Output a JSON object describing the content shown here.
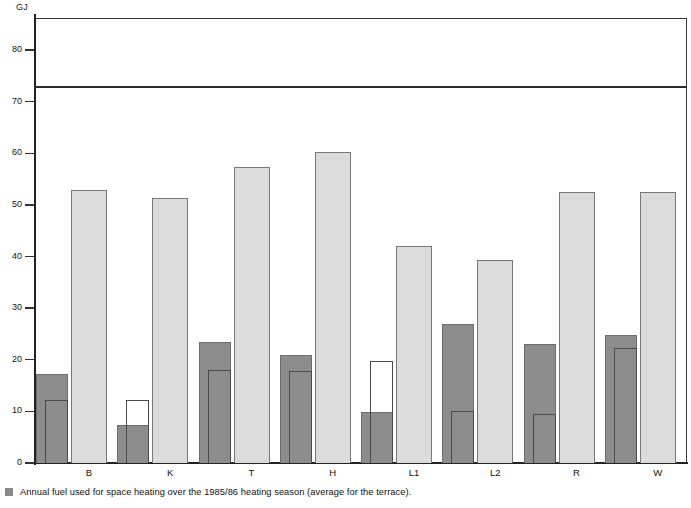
{
  "chart_data": {
    "type": "bar",
    "title": "",
    "subtitle": "",
    "xlabel": "",
    "ylabel": "GJ",
    "unit_label": "GJ",
    "ylim": [
      0,
      86
    ],
    "yticks": [
      0,
      10,
      20,
      30,
      40,
      50,
      60,
      70,
      80
    ],
    "ytick_labels": [
      "0",
      "10",
      "20",
      "30",
      "40",
      "50",
      "60",
      "70",
      "80"
    ],
    "grid": false,
    "legend_position": "below-axis-left",
    "categories": [
      "B",
      "K",
      "T",
      "H",
      "L1",
      "L2",
      "R",
      "W"
    ],
    "series": [
      {
        "name": "annual-fuel-dark-outer",
        "style": "dark-grey-filled",
        "color": "#8c8c8c",
        "values": [
          17.3,
          7.3,
          23.5,
          21.0,
          9.8,
          27.0,
          23.1,
          24.7
        ]
      },
      {
        "name": "annual-fuel-inner-outline",
        "style": "outlined-sub-bar",
        "color": "#4a4a4a",
        "values": [
          12.2,
          12.2,
          18.0,
          17.8,
          19.8,
          10.1,
          9.5,
          22.2
        ]
      },
      {
        "name": "annual-fuel-light",
        "style": "light-grey-filled",
        "color": "#dcdcdc",
        "values": [
          52.8,
          51.3,
          57.4,
          60.3,
          42.0,
          39.4,
          52.5,
          52.4
        ]
      }
    ],
    "reference_line": {
      "name": "terrace-average",
      "value": 73,
      "color": "#2b2b2b"
    },
    "legend": [
      {
        "swatch_color": "#8a8a8a",
        "label": "Annual fuel used for space heating over the 1985/86 heating season (average for the terrace)."
      }
    ]
  }
}
